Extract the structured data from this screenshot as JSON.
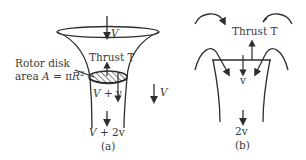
{
  "figure": {
    "panel_a": {
      "caption": "(a)",
      "inflow_label": "V",
      "thrust_label": "Thrust T",
      "rotor_label_line1": "Rotor disk",
      "rotor_label_line2_prefix": "area ",
      "rotor_label_A": "A",
      "rotor_label_eq": " = π",
      "rotor_label_R": "R",
      "rotor_label_exp": "2",
      "disk_velocity_V": "V",
      "disk_velocity_rest": " + v",
      "wake_velocity_V": "V",
      "wake_velocity_rest": " + 2v",
      "freestream_label": "V"
    },
    "panel_b": {
      "caption": "(b)",
      "thrust_label": "Thrust T",
      "disk_velocity": "v",
      "wake_velocity": "2v"
    },
    "colors": {
      "stroke": "#2e2e2e",
      "text": "#3a3a3a",
      "background": "#ffffff"
    }
  }
}
